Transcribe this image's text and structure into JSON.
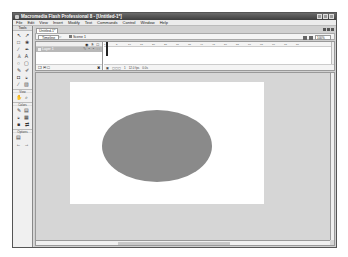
{
  "window": {
    "title": "Macromedia Flash Professional 8 - [Untitled-1*]",
    "controls": [
      "minimize",
      "maximize",
      "close"
    ]
  },
  "menubar": {
    "items": [
      "File",
      "Edit",
      "View",
      "Insert",
      "Modify",
      "Text",
      "Commands",
      "Control",
      "Window",
      "Help"
    ]
  },
  "tools": {
    "header": "Tools",
    "items": [
      "arrow-icon",
      "subselect-icon",
      "free-transform-icon",
      "lasso-icon",
      "line-icon",
      "pen-icon",
      "text-icon",
      "oval-icon",
      "rectangle-icon",
      "pencil-icon",
      "brush-icon",
      "ink-bottle-icon",
      "paint-bucket-icon",
      "eyedropper-icon",
      "eraser-icon"
    ],
    "view_label": "View",
    "view_items": [
      "hand-icon",
      "zoom-icon"
    ],
    "colors_label": "Colors",
    "colors_items": [
      "stroke-color-icon",
      "fill-color-icon",
      "swap-colors-icon"
    ],
    "options_label": "Options",
    "options_items": [
      "snap-icon",
      "smooth-icon"
    ]
  },
  "document": {
    "tab": "Untitled-1*",
    "timeline_button": "Timeline",
    "scene": "Scene 1",
    "zoom": "100%"
  },
  "timeline": {
    "header_icons": "◉ § □",
    "layer_name": "Layer 1",
    "ruler": [
      "1",
      "5",
      "10",
      "15",
      "20",
      "25",
      "30",
      "35",
      "40",
      "45",
      "50",
      "55",
      "60",
      "65",
      "70",
      "75",
      "80"
    ],
    "frame_info": [
      "1",
      "12.0 fps",
      "0.0s"
    ]
  },
  "stage": {
    "background": "#ffffff",
    "shape": {
      "type": "ellipse",
      "fill": "#8a8a8a"
    }
  }
}
